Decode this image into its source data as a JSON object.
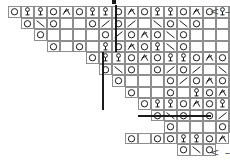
{
  "chart": {
    "cell_width": 13,
    "cell_height": 11.5,
    "grid_columns": 18,
    "grid_rows": 12,
    "symbol_legend": {
      "O": "yarn-over",
      "B": "knot-bobble",
      "A": "central-double-decrease",
      "S": "ssk-left-leaning-decrease",
      "K": "k2tog-right-leaning-decrease",
      ".": "blank-no-stitch"
    },
    "symbol_glyphs": {
      "O": "○",
      "B": "ʕ",
      "A": "⋏",
      "S": "\\",
      "K": "/",
      ".": ""
    },
    "colors": {
      "cell_border": "#8e8e8e",
      "repeat_line": "#1a1a1a",
      "cell_fill": "#ffffff",
      "marker_text": "#4a4a4a"
    },
    "rows": [
      {
        "id": "row-1",
        "x": 8,
        "y": 6,
        "cells": [
          "O",
          "B",
          "B",
          "O",
          "A",
          "O",
          "B",
          "B",
          "O",
          "A",
          "O",
          "B",
          "B",
          "O",
          "A",
          "O",
          "B",
          "B",
          "O",
          "A"
        ]
      },
      {
        "id": "row-2",
        "x": 21,
        "y": 17.5,
        "cells": [
          "O",
          "S",
          "O",
          ".",
          ".",
          "O",
          "K",
          "O",
          "K",
          ".",
          "S",
          "O",
          "S",
          "O",
          ".",
          ".",
          "O",
          "K",
          "O",
          "K"
        ]
      },
      {
        "id": "row-3",
        "x": 34,
        "y": 29,
        "cells": [
          "O",
          ".",
          ".",
          ".",
          ".",
          "O",
          "K",
          "O",
          "A",
          "O",
          "S",
          "O",
          ".",
          ".",
          ".",
          ".",
          "O",
          "K",
          "O",
          "A"
        ]
      },
      {
        "id": "row-4",
        "x": 47,
        "y": 40.5,
        "cells": [
          "O",
          ".",
          "O",
          ".",
          "B",
          "O",
          "A",
          "O",
          "B",
          "S",
          "O",
          ".",
          ".",
          ".",
          "O",
          "K",
          "B",
          "O",
          "A"
        ]
      },
      {
        "id": "row-5",
        "x": 86,
        "y": 52,
        "cells": [
          "O",
          "B",
          "B",
          "O",
          "A",
          "O",
          "B",
          "B",
          "O",
          "A",
          "O",
          "B",
          "B",
          "O",
          "A"
        ]
      },
      {
        "id": "row-6",
        "x": 99,
        "y": 63.5,
        "cells": [
          "O",
          "S",
          "O",
          ".",
          "O",
          "K",
          "O",
          "K",
          ".",
          "S",
          "O",
          "S",
          "O"
        ]
      },
      {
        "id": "row-7",
        "x": 112,
        "y": 75,
        "cells": [
          "O",
          ".",
          ".",
          ".",
          "O",
          "K",
          "O",
          "A",
          "O",
          "S",
          "O"
        ]
      },
      {
        "id": "row-8",
        "x": 125,
        "y": 86.5,
        "cells": [
          "O",
          ".",
          ".",
          "O",
          ".",
          "B",
          "O",
          "A",
          "O",
          "B",
          "S",
          "O"
        ]
      },
      {
        "id": "row-9",
        "x": 138,
        "y": 98,
        "cells": [
          "O",
          "B",
          "B",
          "O",
          "A",
          "O",
          "B",
          "B",
          "O",
          "A"
        ]
      },
      {
        "id": "row-10",
        "x": 151,
        "y": 109.5,
        "cells": [
          "O",
          "S",
          "O",
          ".",
          "O",
          "K",
          "O",
          "K"
        ]
      },
      {
        "id": "row-11",
        "x": 164,
        "y": 121,
        "cells": [
          "O",
          ".",
          ".",
          ".",
          "O",
          "K",
          "O",
          "A"
        ]
      },
      {
        "id": "row-12",
        "x": 125,
        "y": 132.5,
        "cells": [
          "O",
          ".",
          "O",
          ".",
          "B",
          "O",
          "A"
        ]
      },
      {
        "id": "row-13",
        "x": 164,
        "y": 132.5,
        "cells": [
          "O",
          "B",
          "B",
          "O",
          "A"
        ]
      },
      {
        "id": "row-14",
        "x": 177,
        "y": 144,
        "cells": [
          "O",
          "S",
          "O"
        ]
      },
      {
        "id": "row-15",
        "x": 177,
        "y": 144,
        "cells": []
      }
    ],
    "repeat_lines": [
      {
        "id": "rl-1",
        "x": 115,
        "y": 5,
        "h": 47,
        "orient": "v"
      },
      {
        "id": "rl-2",
        "x": 102,
        "y": 52,
        "h": 46,
        "orient": "v"
      },
      {
        "id": "rl-3",
        "x": 102,
        "y": 98,
        "h": 12,
        "orient": "v"
      },
      {
        "id": "rl-4",
        "x": 138,
        "y": 115,
        "w": 73,
        "orient": "h"
      }
    ],
    "row_markers": [
      {
        "id": "marker-top",
        "label": "< –",
        "x": 210,
        "y": 6
      },
      {
        "id": "marker-bottom",
        "label": "< –",
        "x": 210,
        "y": 147
      }
    ],
    "top_tick": {
      "id": "top-tick",
      "x": 112,
      "y": 0,
      "w": 4,
      "h": 4
    }
  }
}
